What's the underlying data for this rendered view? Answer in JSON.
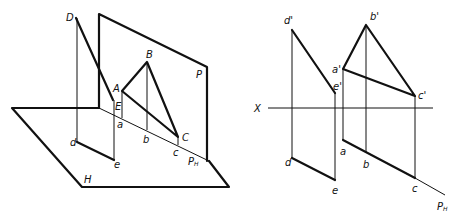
{
  "left_view": {
    "planes": {
      "H": "H",
      "P": "P",
      "PH": "P",
      "PH_sub": "H"
    },
    "points_space": {
      "A": "A",
      "B": "B",
      "C": "C",
      "D": "D",
      "E": "E"
    },
    "points_horizontal": {
      "a": "a",
      "b": "b",
      "c": "c",
      "d": "d",
      "e": "e"
    }
  },
  "right_view": {
    "axis": "X",
    "trace": "P",
    "trace_sub": "H",
    "points_front": {
      "a": "a'",
      "b": "b'",
      "c": "c'",
      "d": "d'",
      "e": "e'"
    },
    "points_top": {
      "a": "a",
      "b": "b",
      "c": "c",
      "d": "d",
      "e": "e"
    }
  },
  "colors": {
    "line": "#111111",
    "background": "#ffffff"
  }
}
